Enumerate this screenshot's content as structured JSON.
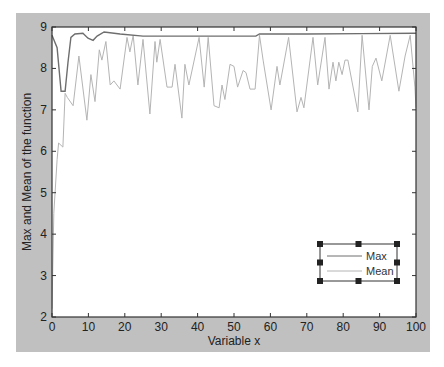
{
  "figure": {
    "background": "#c0c0c0",
    "axes_background": "#ffffff"
  },
  "chart_data": {
    "type": "line",
    "title": "",
    "xlabel": "Variable x",
    "ylabel": "Max and Mean of the function",
    "xlim": [
      0,
      100
    ],
    "ylim": [
      2,
      9
    ],
    "xticks": [
      0,
      10,
      20,
      30,
      40,
      50,
      60,
      70,
      80,
      90,
      100
    ],
    "yticks": [
      2,
      3,
      4,
      5,
      6,
      7,
      8,
      9
    ],
    "grid": false,
    "legend": {
      "position": "lower right",
      "entries": [
        "Max",
        "Mean"
      ],
      "selected": true
    },
    "series": [
      {
        "name": "Max",
        "color": "#6e6e6e",
        "x": [
          0,
          1.4,
          2.5,
          3.6,
          4.4,
          5.2,
          6.3,
          8.5,
          9.9,
          11.3,
          12.4,
          14.3,
          18.7,
          25,
          40,
          56,
          57,
          70,
          85,
          100
        ],
        "y": [
          8.8,
          8.5,
          7.45,
          7.45,
          8.15,
          8.75,
          8.83,
          8.85,
          8.73,
          8.68,
          8.78,
          8.88,
          8.83,
          8.78,
          8.78,
          8.78,
          8.83,
          8.83,
          8.84,
          8.85
        ]
      },
      {
        "name": "Mean",
        "color": "#b4b4b4",
        "x": [
          0,
          0.5,
          1.4,
          1.8,
          3,
          3.6,
          4.2,
          5.8,
          7.4,
          9.6,
          10.7,
          11.8,
          13,
          13.7,
          14.8,
          16,
          17,
          18.7,
          20.6,
          21.4,
          22.3,
          23.6,
          25,
          26.9,
          28.3,
          28.8,
          29.7,
          31.6,
          33,
          33.8,
          35.7,
          36.5,
          37.6,
          40.4,
          41.8,
          42.9,
          44.5,
          45.9,
          46.7,
          47.5,
          48.9,
          50,
          51,
          52.5,
          53.3,
          54.4,
          55.8,
          57,
          58,
          60.2,
          61.8,
          62.6,
          65,
          67.3,
          68.4,
          69.2,
          71.7,
          73,
          75,
          76.1,
          77.2,
          78,
          78.8,
          79.7,
          80.5,
          81.3,
          84,
          85.2,
          87.1,
          88,
          89,
          90.6,
          92.9,
          95.3,
          97,
          98.4,
          99.7,
          100
        ],
        "y": [
          2.2,
          4.5,
          5.8,
          6.2,
          6.1,
          7.4,
          7.3,
          7.1,
          8.3,
          6.75,
          7.85,
          7.2,
          8.45,
          8.2,
          8.65,
          7.6,
          7.7,
          7.5,
          8.75,
          8.4,
          8.8,
          7.6,
          8.7,
          6.9,
          8.65,
          8.15,
          8.7,
          7.55,
          7.55,
          8.1,
          6.8,
          8.1,
          7.6,
          8.75,
          7.55,
          8.75,
          7.1,
          7.05,
          7.6,
          7.25,
          8.1,
          8.05,
          7.55,
          7.95,
          7.9,
          7.5,
          7.5,
          8.8,
          8.2,
          7.0,
          8.05,
          7.6,
          8.75,
          6.95,
          7.3,
          7.05,
          8.75,
          7.6,
          8.75,
          7.5,
          8.15,
          7.7,
          8.15,
          7.85,
          8.2,
          8.2,
          6.95,
          8.8,
          7.0,
          8.05,
          8.25,
          7.7,
          8.8,
          7.45,
          8.3,
          8.8,
          7.55,
          7.05
        ]
      }
    ]
  }
}
